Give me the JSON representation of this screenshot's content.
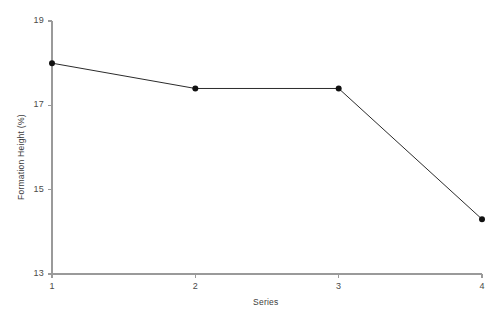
{
  "chart_data": {
    "type": "line",
    "title": "",
    "subtitle": "",
    "xlabel": "Series",
    "ylabel": "Formation Height (%)",
    "x": [
      1,
      2,
      3,
      4
    ],
    "values": [
      18.0,
      17.4,
      17.4,
      14.3
    ],
    "categories": [
      "1",
      "2",
      "3",
      "4"
    ],
    "series": [
      {
        "name": "Formation Height",
        "values": [
          18.0,
          17.4,
          17.4,
          14.3
        ]
      }
    ],
    "xlim": [
      1,
      4
    ],
    "ylim": [
      13,
      19
    ],
    "xticks": [
      1,
      2,
      3,
      4
    ],
    "yticks": [
      13,
      15,
      17,
      19
    ],
    "xtick_labels": [
      "1",
      "2",
      "3",
      "4"
    ],
    "ytick_labels": [
      "13",
      "15",
      "17",
      "19"
    ],
    "grid": false,
    "legend": false,
    "legend_position": "none",
    "marker": "filled-circle",
    "line_color": "#2b2b2b",
    "marker_color": "#111111",
    "axis_color": "#9a9a9a",
    "text_color": "#3d3d3d",
    "background_color": "#ffffff"
  },
  "axes": {
    "y_title": "Formation Height (%)",
    "x_title": "Series",
    "y_ticks": [
      {
        "label": "19",
        "value": 19
      },
      {
        "label": "17",
        "value": 17
      },
      {
        "label": "15",
        "value": 15
      },
      {
        "label": "13",
        "value": 13
      }
    ],
    "x_ticks": [
      {
        "label": "1",
        "value": 1
      },
      {
        "label": "2",
        "value": 2
      },
      {
        "label": "3",
        "value": 3
      },
      {
        "label": "4",
        "value": 4
      }
    ]
  }
}
